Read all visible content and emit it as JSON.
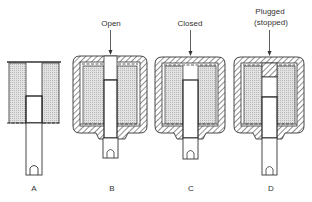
{
  "figures": [
    {
      "id": "A",
      "label": "A",
      "caption": "",
      "state": "bare"
    },
    {
      "id": "B",
      "label": "B",
      "caption": "Open",
      "state": "open"
    },
    {
      "id": "C",
      "label": "C",
      "caption": "Closed",
      "state": "closed"
    },
    {
      "id": "D",
      "label": "D",
      "caption_line1": "Plugged",
      "caption_line2": "(stopped)",
      "state": "plugged"
    }
  ],
  "colors": {
    "line": "#333333",
    "fill": "#d8d8d8",
    "hatch": "#444444"
  }
}
